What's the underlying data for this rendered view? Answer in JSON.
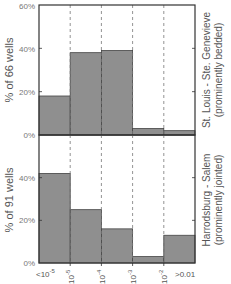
{
  "chart_data": [
    {
      "type": "bar",
      "title": "",
      "categories": [
        "<10^-5",
        "10^-5",
        "10^-4",
        "10^-3",
        "10^-2",
        ">0.01"
      ],
      "bin_edges_labels": [
        "<10^-5",
        "10^-5",
        "10^-4",
        "10^-3",
        "10^-2",
        ">0.01"
      ],
      "values": [
        18,
        38,
        39,
        3,
        2
      ],
      "ylabel": "% of 66 wells",
      "yticks": [
        "0%",
        "20%",
        "40%",
        "60%"
      ],
      "ylim": [
        0,
        60
      ],
      "side_label_line1": "St. Louis - Ste. Genevieve",
      "side_label_line2": "(prominently bedded)",
      "grid": "vertical dashed lines at bin edges"
    },
    {
      "type": "bar",
      "title": "",
      "values": [
        42,
        25,
        16,
        3,
        13
      ],
      "ylabel": "% of 91 wells",
      "yticks": [
        "0%",
        "20%",
        "40%"
      ],
      "ylim": [
        0,
        60
      ],
      "side_label_line1": "Harrodsburg - Salem",
      "side_label_line2": "(prominently jointed)",
      "grid": "vertical dashed lines at bin edges"
    }
  ],
  "xticks": {
    "t0": "<10",
    "t0_exp": "-5",
    "t1": "10",
    "t1_exp": "-5",
    "t2": "10",
    "t2_exp": "-4",
    "t3": "10",
    "t3_exp": "-3",
    "t4": "10",
    "t4_exp": "-2",
    "t5": ">0.01"
  },
  "colors": {
    "bar": "#8f8f8f",
    "axis": "#333333",
    "text": "#555555",
    "grid": "#777777"
  }
}
